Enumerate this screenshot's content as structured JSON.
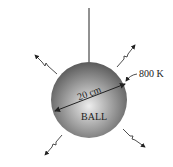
{
  "diagram": {
    "object_label": "BALL",
    "diameter_label": "20 cm",
    "temperature_label": "800 K",
    "colors": {
      "ball_light": "#e6e6e6",
      "ball_dark": "#5a5a5a",
      "stroke": "#222222"
    }
  }
}
